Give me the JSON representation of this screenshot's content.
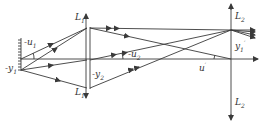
{
  "diagram": {
    "type": "optical-relay-system",
    "colors": {
      "line": "#3a3a3a",
      "background": "#ffffff"
    },
    "labels": {
      "L1_top": {
        "base": "L",
        "sub": "1"
      },
      "L1_bottom": {
        "base": "L",
        "sub": "1"
      },
      "L2_top": {
        "base": "L",
        "sub": "2"
      },
      "L2_bottom": {
        "base": "L",
        "sub": "2"
      },
      "u1": {
        "base": "-u",
        "sub": "1"
      },
      "y1": {
        "base": "-y",
        "sub": "1"
      },
      "u2": {
        "base": "-u",
        "sub": "2"
      },
      "y2": {
        "base": "-y",
        "sub": "2"
      },
      "y1_prime": {
        "base": "y",
        "sub": "1",
        "sup": "′"
      },
      "u_prime": {
        "base": "u",
        "sup": "′"
      }
    }
  }
}
